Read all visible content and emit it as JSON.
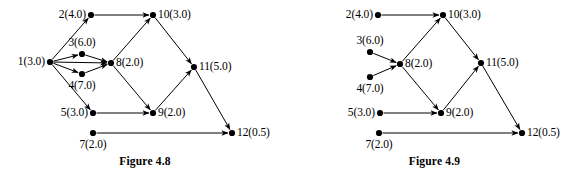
{
  "figures": [
    {
      "id": "figure-4-8",
      "caption": "Figure 4.8",
      "nodes": [
        {
          "id": "1",
          "label": "1(3.0)",
          "x": 50,
          "y": 62,
          "anchor": "left"
        },
        {
          "id": "2",
          "label": "2(4.0)",
          "x": 91,
          "y": 15,
          "anchor": "left"
        },
        {
          "id": "3",
          "label": "3(6.0)",
          "x": 82,
          "y": 54,
          "anchor": "above"
        },
        {
          "id": "4",
          "label": "4(7.0)",
          "x": 82,
          "y": 74,
          "anchor": "below"
        },
        {
          "id": "5",
          "label": "5(3.0)",
          "x": 93,
          "y": 113,
          "anchor": "left"
        },
        {
          "id": "7",
          "label": "7(2.0)",
          "x": 93,
          "y": 133,
          "anchor": "below"
        },
        {
          "id": "8",
          "label": "8(2.0)",
          "x": 111,
          "y": 63,
          "anchor": "right"
        },
        {
          "id": "9",
          "label": "9(2.0)",
          "x": 153,
          "y": 113,
          "anchor": "right"
        },
        {
          "id": "10",
          "label": "10(3.0)",
          "x": 153,
          "y": 15,
          "anchor": "right"
        },
        {
          "id": "11",
          "label": "11(5.0)",
          "x": 194,
          "y": 67,
          "anchor": "right"
        },
        {
          "id": "12",
          "label": "12(0.5)",
          "x": 232,
          "y": 133,
          "anchor": "right"
        }
      ],
      "edges": [
        {
          "from": "1",
          "to": "2"
        },
        {
          "from": "1",
          "to": "3"
        },
        {
          "from": "1",
          "to": "4"
        },
        {
          "from": "1",
          "to": "5"
        },
        {
          "from": "1",
          "to": "8"
        },
        {
          "from": "3",
          "to": "8"
        },
        {
          "from": "4",
          "to": "8"
        },
        {
          "from": "2",
          "to": "10"
        },
        {
          "from": "8",
          "to": "10"
        },
        {
          "from": "8",
          "to": "9"
        },
        {
          "from": "5",
          "to": "9"
        },
        {
          "from": "7",
          "to": "12"
        },
        {
          "from": "9",
          "to": "11"
        },
        {
          "from": "10",
          "to": "11"
        },
        {
          "from": "11",
          "to": "12"
        }
      ]
    },
    {
      "id": "figure-4-9",
      "caption": "Figure 4.9",
      "nodes": [
        {
          "id": "2",
          "label": "2(4.0)",
          "x": 88,
          "y": 15,
          "anchor": "left"
        },
        {
          "id": "3",
          "label": "3(6.0)",
          "x": 80,
          "y": 52,
          "anchor": "above"
        },
        {
          "id": "4",
          "label": "4(7.0)",
          "x": 80,
          "y": 77,
          "anchor": "below"
        },
        {
          "id": "5",
          "label": "5(3.0)",
          "x": 90,
          "y": 113,
          "anchor": "left"
        },
        {
          "id": "7",
          "label": "7(2.0)",
          "x": 89,
          "y": 133,
          "anchor": "below"
        },
        {
          "id": "8",
          "label": "8(2.0)",
          "x": 110,
          "y": 64,
          "anchor": "right"
        },
        {
          "id": "9",
          "label": "9(2.0)",
          "x": 151,
          "y": 113,
          "anchor": "right"
        },
        {
          "id": "10",
          "label": "10(3.0)",
          "x": 153,
          "y": 15,
          "anchor": "right"
        },
        {
          "id": "11",
          "label": "11(5.0)",
          "x": 191,
          "y": 63,
          "anchor": "right"
        },
        {
          "id": "12",
          "label": "12(0.5)",
          "x": 232,
          "y": 133,
          "anchor": "right"
        }
      ],
      "edges": [
        {
          "from": "3",
          "to": "8"
        },
        {
          "from": "4",
          "to": "8"
        },
        {
          "from": "2",
          "to": "10"
        },
        {
          "from": "8",
          "to": "10"
        },
        {
          "from": "8",
          "to": "9"
        },
        {
          "from": "5",
          "to": "9"
        },
        {
          "from": "7",
          "to": "12"
        },
        {
          "from": "9",
          "to": "11"
        },
        {
          "from": "10",
          "to": "11"
        },
        {
          "from": "11",
          "to": "12"
        }
      ]
    }
  ],
  "style": {
    "stroke": "#000000",
    "node_fill": "#000000",
    "node_radius": 3.1,
    "edge_width": 1.0
  }
}
